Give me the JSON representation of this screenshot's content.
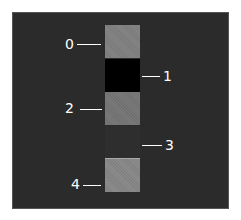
{
  "diagram": {
    "blocks": [
      {
        "label": "0",
        "color": "#858585",
        "side": "left"
      },
      {
        "label": "1",
        "color": "#000000",
        "side": "right"
      },
      {
        "label": "2",
        "color": "#7a7a7a",
        "side": "left"
      },
      {
        "label": "3",
        "color": "#2e2e2e",
        "side": "right"
      },
      {
        "label": "4",
        "color": "#8c8c8c",
        "side": "left"
      }
    ],
    "background": "#2b2b2b"
  }
}
